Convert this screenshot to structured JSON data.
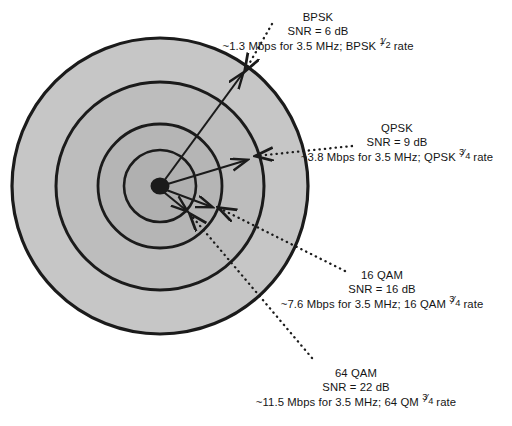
{
  "diagram": {
    "center_label": "base-station",
    "colors": {
      "zone_outer": "#c6c6c6",
      "zone_third": "#bdbdbd",
      "zone_second": "#b5b5b5",
      "zone_inner": "#b0b0b0",
      "stroke": "#1b1b1b",
      "background": "#ffffff",
      "text": "#151515"
    },
    "zones": [
      {
        "id": "bpsk",
        "name": "BPSK",
        "radius": 148,
        "fill": "#c6c6c6"
      },
      {
        "id": "qpsk",
        "name": "QPSK",
        "radius": 104,
        "fill": "#bdbdbd"
      },
      {
        "id": "16qam",
        "name": "16 QAM",
        "radius": 62,
        "fill": "#b5b5b5"
      },
      {
        "id": "64qam",
        "name": "64 QAM",
        "radius": 36,
        "fill": "#b0b0b0"
      }
    ]
  },
  "labels": {
    "bpsk": {
      "title": "BPSK",
      "snr": "SNR = 6 dB",
      "rate_prefix": "~1.3 Mbps for 3.5 MHz; BPSK ",
      "rate_num": "1",
      "rate_den": "2",
      "rate_suffix": " rate"
    },
    "qpsk": {
      "title": "QPSK",
      "snr": "SNR = 9 dB",
      "rate_prefix": "~3.8 Mbps for 3.5 MHz; QPSK ",
      "rate_num": "3",
      "rate_den": "4",
      "rate_suffix": " rate"
    },
    "qam16": {
      "title": "16 QAM",
      "snr": "SNR = 16 dB",
      "rate_prefix": "~7.6 Mbps for 3.5 MHz; 16 QAM ",
      "rate_num": "3",
      "rate_den": "4",
      "rate_suffix": " rate"
    },
    "qam64": {
      "title": "64 QAM",
      "snr": "SNR = 22 dB",
      "rate_prefix": "~11.5 Mbps for 3.5 MHz; 64 QM ",
      "rate_num": "3",
      "rate_den": "4",
      "rate_suffix": " rate"
    }
  },
  "chart_data": {
    "type": "diagram",
    "subtype": "concentric-coverage-rings",
    "center": {
      "x": 160,
      "y": 186
    },
    "series": [
      {
        "name": "BPSK",
        "radius_px": 148,
        "snr_db": 6,
        "throughput_mbps": 1.3,
        "channel_mhz": 3.5,
        "code_rate": "1/2",
        "label": "~1.3 Mbps for 3.5 MHz; BPSK 1/2 rate"
      },
      {
        "name": "QPSK",
        "radius_px": 104,
        "snr_db": 9,
        "throughput_mbps": 3.8,
        "channel_mhz": 3.5,
        "code_rate": "3/4",
        "label": "~3.8 Mbps for 3.5 MHz; QPSK 3/4 rate"
      },
      {
        "name": "16 QAM",
        "radius_px": 62,
        "snr_db": 16,
        "throughput_mbps": 7.6,
        "channel_mhz": 3.5,
        "code_rate": "3/4",
        "label": "~7.6 Mbps for 3.5 MHz; 16 QAM 3/4 rate"
      },
      {
        "name": "64 QAM",
        "radius_px": 36,
        "snr_db": 22,
        "throughput_mbps": 11.5,
        "channel_mhz": 3.5,
        "code_rate": "3/4",
        "label": "~11.5 Mbps for 3.5 MHz; 64 QM 3/4 rate"
      }
    ]
  }
}
